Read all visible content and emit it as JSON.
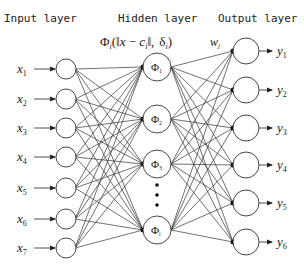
{
  "layers": {
    "input_title": "Input layer",
    "hidden_title": "Hidden layer",
    "output_title": "Output layer"
  },
  "formula": {
    "phi": "Φ",
    "sub_i": "i",
    "open": "(‖",
    "x": "x",
    "minus": " − ",
    "c": "c",
    "close_norm": "‖,",
    "delta": "δ",
    "close": ")"
  },
  "weight_label": {
    "w": "w",
    "sub": "j"
  },
  "inputs": [
    {
      "var": "x",
      "sub": "1"
    },
    {
      "var": "x",
      "sub": "2"
    },
    {
      "var": "x",
      "sub": "3"
    },
    {
      "var": "x",
      "sub": "4"
    },
    {
      "var": "x",
      "sub": "5"
    },
    {
      "var": "x",
      "sub": "6"
    },
    {
      "var": "x",
      "sub": "7"
    }
  ],
  "hidden": [
    {
      "symbol": "Φ",
      "sub": "1"
    },
    {
      "symbol": "Φ",
      "sub": "2"
    },
    {
      "symbol": "Φ",
      "sub": "3"
    },
    {
      "symbol": "Φ",
      "sub": "i"
    }
  ],
  "hidden_ellipsis": "⋮",
  "outputs": [
    {
      "var": "y",
      "sub": "1"
    },
    {
      "var": "y",
      "sub": "2"
    },
    {
      "var": "y",
      "sub": "3"
    },
    {
      "var": "y",
      "sub": "4"
    },
    {
      "var": "y",
      "sub": "5"
    },
    {
      "var": "y",
      "sub": "6"
    }
  ],
  "colors": {
    "stroke": "#333333",
    "text": "#222222",
    "background": "#ffffff"
  }
}
